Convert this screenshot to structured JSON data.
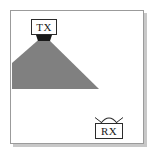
{
  "figure": {
    "title": "Transmitter and receiver coverage diagram",
    "background_color": "#ffffff",
    "frame_border_color": "#9b9b9b",
    "frame_shadow_color": "#c8c8c8"
  },
  "nodes": {
    "transmitter": {
      "label": "TX",
      "name": "transmitter",
      "box_fill": "#ffffff",
      "box_stroke": "#2b2b2b",
      "antenna_color": "#1a1a1a",
      "x": 33,
      "y": 16
    },
    "receiver": {
      "label": "RX",
      "name": "receiver",
      "box_fill": "#ffffff",
      "box_stroke": "#2b2b2b",
      "antenna_color": "#2b2b2b",
      "x": 98,
      "y": 119
    }
  },
  "beam": {
    "name": "coverage-beam",
    "fill_color": "#808080",
    "description": "Gray triangular coverage region spreading from the transmitter downward and to the left, clipped by the left frame edge, with a flat bottom edge."
  }
}
